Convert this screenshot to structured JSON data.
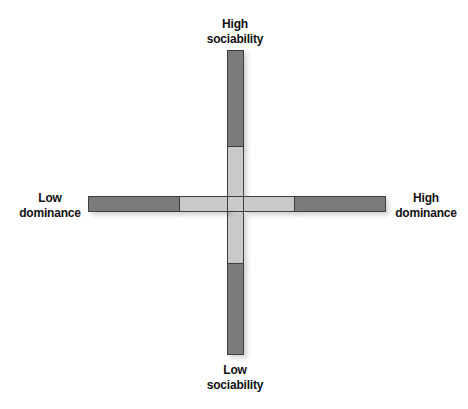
{
  "diagram": {
    "type": "quadrant-axes",
    "labels": {
      "top": {
        "line1": "High",
        "line2": "sociability"
      },
      "bottom": {
        "line1": "Low",
        "line2": "sociability"
      },
      "left": {
        "line1": "Low",
        "line2": "dominance"
      },
      "right": {
        "line1": "High",
        "line2": "dominance"
      }
    },
    "colors": {
      "outer_segment": "#7b7b7b",
      "inner_segment": "#c9c9c9",
      "border": "#3f3f3f",
      "background": "#ffffff"
    }
  }
}
